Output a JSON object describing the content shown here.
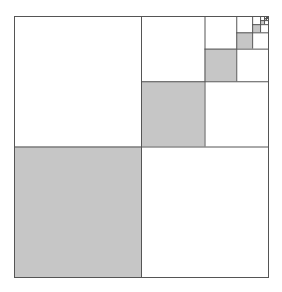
{
  "diagram": {
    "type": "recursive-square-dissection",
    "series": "1/4 + 1/16 + 1/64 + ... = 1/3",
    "outer": {
      "x": 14,
      "y": 16,
      "width": 254,
      "height": 261
    },
    "levels": 8,
    "colors": {
      "background": "#ffffff",
      "fill": "#c6c6c6",
      "stroke": "#555555"
    },
    "stroke_width": 1
  },
  "chart_data": {
    "type": "diagram",
    "title": "",
    "shaded_fractions": [
      0.25,
      0.0625,
      0.015625,
      0.00390625,
      0.0009765625,
      0.000244140625
    ],
    "total_shaded": 0.3333
  }
}
